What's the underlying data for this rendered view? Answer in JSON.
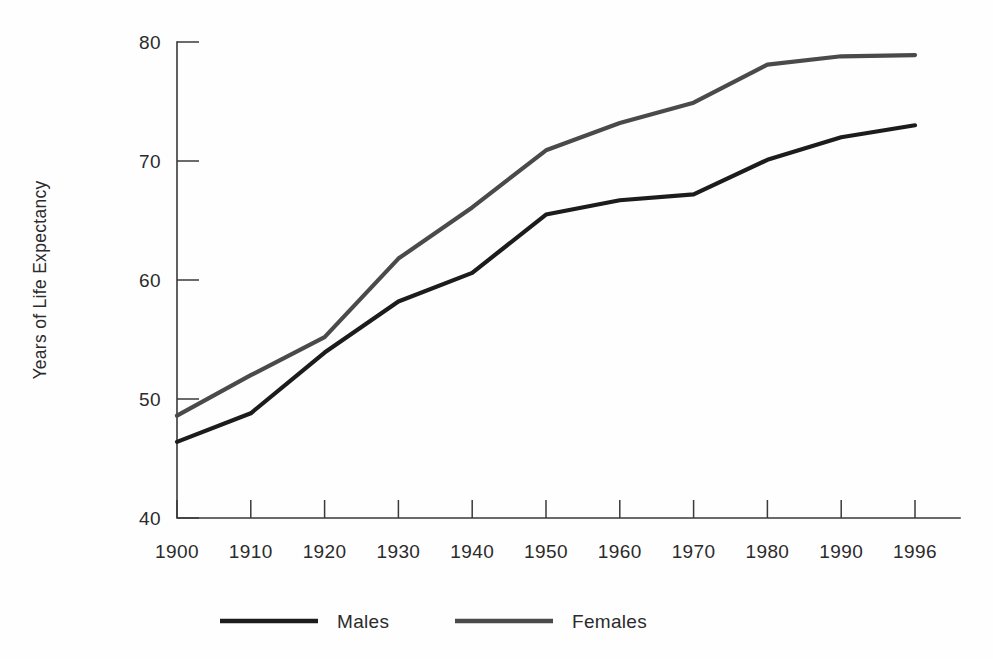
{
  "chart_data": {
    "type": "line",
    "title": "",
    "xlabel": "",
    "ylabel": "Years of Life Expectancy",
    "categories": [
      "1900",
      "1910",
      "1920",
      "1930",
      "1940",
      "1950",
      "1960",
      "1970",
      "1980",
      "1990",
      "1996"
    ],
    "x": [
      1900,
      1910,
      1920,
      1930,
      1940,
      1950,
      1960,
      1970,
      1980,
      1990,
      1996
    ],
    "series": [
      {
        "name": "Males",
        "color": "#1c1c1c",
        "values": [
          46.4,
          48.8,
          53.9,
          58.2,
          60.6,
          65.5,
          66.7,
          67.2,
          70.1,
          72.0,
          73.0
        ]
      },
      {
        "name": "Females",
        "color": "#4a4a4a",
        "values": [
          48.6,
          52.0,
          55.2,
          61.8,
          66.1,
          70.9,
          73.2,
          74.9,
          78.1,
          78.8,
          78.9
        ]
      }
    ],
    "ylim": [
      40,
      80
    ],
    "yticks": [
      40,
      50,
      60,
      70,
      80
    ],
    "ytick_labels": [
      "40",
      "50",
      "60",
      "70",
      "80"
    ],
    "xlim": [
      1900,
      1996
    ],
    "grid": false,
    "legend_position": "bottom",
    "legend_entries": [
      "Males",
      "Females"
    ]
  },
  "axes": {
    "y_axis_label": "Years of Life Expectancy",
    "y_tick_labels": [
      "80",
      "70",
      "60",
      "50",
      "40"
    ],
    "x_tick_labels": [
      "1900",
      "1910",
      "1920",
      "1930",
      "1940",
      "1950",
      "1960",
      "1970",
      "1980",
      "1990",
      "1996"
    ]
  },
  "legend": {
    "items": [
      {
        "label": "Males",
        "color": "#1c1c1c"
      },
      {
        "label": "Females",
        "color": "#4a4a4a"
      }
    ]
  },
  "colors": {
    "background": "#fefefe",
    "axis": "#3a3a3a",
    "text": "#2b2b2b",
    "males_line": "#1c1c1c",
    "females_line": "#4a4a4a"
  }
}
